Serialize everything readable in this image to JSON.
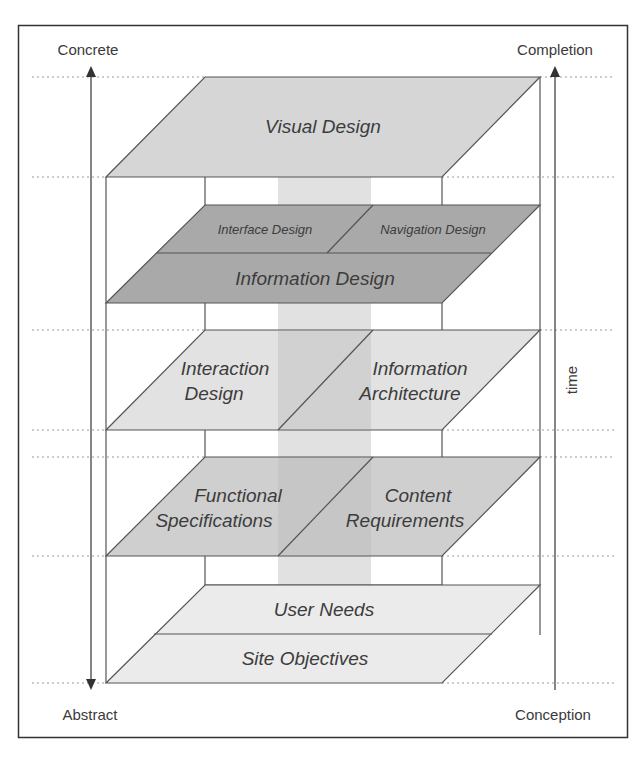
{
  "axes": {
    "left_top": "Concrete",
    "left_bottom": "Abstract",
    "right_top": "Completion",
    "right_bottom": "Conception",
    "right_side": "time"
  },
  "planes": {
    "surface": {
      "label": "Visual Design",
      "color": "#d6d6d6"
    },
    "skeleton": {
      "top_left": "Interface Design",
      "top_right": "Navigation Design",
      "bottom": "Information Design",
      "color": "#a9a9a9"
    },
    "structure": {
      "left": [
        "Interaction",
        "Design"
      ],
      "right": [
        "Information",
        "Architecture"
      ],
      "color": "#e2e2e2"
    },
    "scope": {
      "left": [
        "Functional",
        "Specifications"
      ],
      "right": [
        "Content",
        "Requirements"
      ],
      "color": "#cfcfcf"
    },
    "strategy": {
      "top": "User Needs",
      "bottom": "Site Objectives",
      "color": "#ebebeb"
    }
  },
  "colors": {
    "line": "#555555",
    "dotted": "#9a9a9a",
    "column": "#c8c8c8",
    "frame": "#333333"
  }
}
